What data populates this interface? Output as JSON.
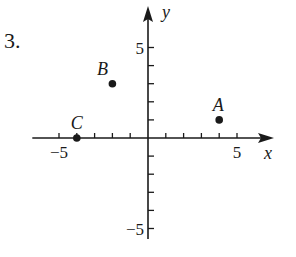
{
  "problem": {
    "number": "3."
  },
  "chart_data": {
    "type": "scatter",
    "title": "",
    "xlabel": "x",
    "ylabel": "y",
    "xlim": [
      -6.5,
      7
    ],
    "ylim": [
      -6,
      6.5
    ],
    "grid": false,
    "x_tick_labels": [
      {
        "value": -5,
        "label": "−5"
      },
      {
        "value": 5,
        "label": "5"
      }
    ],
    "y_tick_labels": [
      {
        "value": 5,
        "label": "5"
      },
      {
        "value": -5,
        "label": "−5"
      }
    ],
    "x_ticks": [
      -5,
      -4,
      -3,
      -2,
      -1,
      1,
      2,
      3,
      4,
      5
    ],
    "y_ticks": [
      -5,
      -4,
      -3,
      -2,
      -1,
      1,
      2,
      3,
      4,
      5
    ],
    "points": [
      {
        "label": "A",
        "x": 4,
        "y": 1
      },
      {
        "label": "B",
        "x": -2,
        "y": 3
      },
      {
        "label": "C",
        "x": -4,
        "y": 0
      }
    ]
  }
}
